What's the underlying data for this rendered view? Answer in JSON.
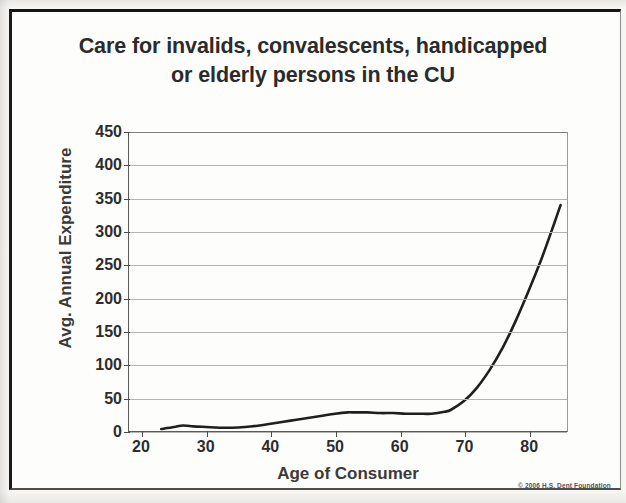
{
  "slide": {
    "title_line1": "Care for invalids, convalescents, handicapped",
    "title_line2": "or elderly persons in the CU",
    "copyright": "© 2006 H.S. Dent Foundation",
    "frame_color": "#141414",
    "background_color": "#fdfdfb",
    "line_color": "#1f1f1f"
  },
  "chart_data": {
    "type": "line",
    "title": "Care for invalids, convalescents, handicapped or elderly persons in the CU",
    "xlabel": "Age of Consumer",
    "ylabel": "Avg. Annual Expenditure",
    "xlim": [
      18,
      86
    ],
    "ylim": [
      0,
      450
    ],
    "xticks": [
      20,
      30,
      40,
      50,
      60,
      70,
      80
    ],
    "yticks": [
      0,
      50,
      100,
      150,
      200,
      250,
      300,
      350,
      400,
      450
    ],
    "grid": true,
    "legend": false,
    "series": [
      {
        "name": "Avg. Annual Expenditure",
        "color": "#1f1f1f",
        "x": [
          23,
          25,
          26,
          27,
          28,
          30,
          32,
          34,
          36,
          38,
          40,
          42,
          44,
          46,
          48,
          50,
          52,
          53,
          55,
          57,
          59,
          61,
          63,
          65,
          67,
          68,
          70,
          72,
          74,
          76,
          78,
          80,
          82,
          84,
          85
        ],
        "values": [
          3,
          6,
          8,
          8,
          7,
          6,
          5,
          5,
          6,
          8,
          11,
          14,
          17,
          20,
          23,
          26,
          28,
          28,
          28,
          27,
          27,
          26,
          26,
          26,
          29,
          32,
          45,
          65,
          92,
          125,
          165,
          210,
          258,
          312,
          340
        ]
      }
    ]
  }
}
